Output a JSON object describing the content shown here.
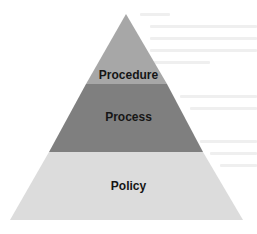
{
  "diagram": {
    "type": "pyramid",
    "layers": [
      {
        "label": "Procedure",
        "position": "top",
        "color": "#a7a7a7"
      },
      {
        "label": "Process",
        "position": "middle",
        "color": "#7f7f7f"
      },
      {
        "label": "Policy",
        "position": "bottom",
        "color": "#dcdcdc"
      }
    ]
  }
}
